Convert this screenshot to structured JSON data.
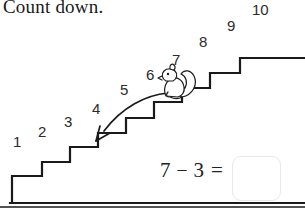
{
  "page": {
    "title": "Count down.",
    "background_color": "#ffffff",
    "line_color": "#1a1a1a"
  },
  "step_numbers": [
    {
      "label": "1",
      "x": 13,
      "y": 134
    },
    {
      "label": "2",
      "x": 38,
      "y": 124
    },
    {
      "label": "3",
      "x": 64,
      "y": 114
    },
    {
      "label": "4",
      "x": 92,
      "y": 101
    },
    {
      "label": "5",
      "x": 120,
      "y": 82
    },
    {
      "label": "6",
      "x": 146,
      "y": 67
    },
    {
      "label": "7",
      "x": 172,
      "y": 52
    },
    {
      "label": "8",
      "x": 199,
      "y": 34
    },
    {
      "label": "9",
      "x": 227,
      "y": 18
    },
    {
      "label": "10",
      "x": 252,
      "y": 2
    }
  ],
  "illustration": {
    "character": "squirrel",
    "arrow": "curved-down-left-arrow",
    "stairs": "ascending-staircase"
  },
  "equation": {
    "left_operand": "7",
    "operator": "–",
    "right_operand": "3",
    "equals": "=",
    "answer_value": "",
    "answer_placeholder": ""
  },
  "colors": {
    "ink": "#1a1a1a",
    "number_ink": "#2b2b2b",
    "answer_box_border": "#e8e8e8"
  }
}
